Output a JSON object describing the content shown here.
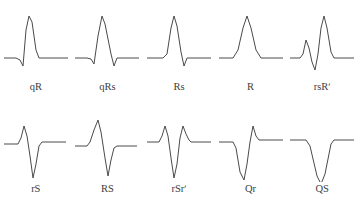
{
  "figure": {
    "title_visible_fragment": "",
    "background_color": "#ffffff",
    "stroke_color": "#4a4a4a",
    "label_color": "#3d3d3d",
    "rows": 2,
    "columns": 5
  },
  "patterns": [
    {
      "id": "qR",
      "label": "qR",
      "row": 0,
      "col": 0,
      "description": "small initial negative q deflection followed by tall positive R wave",
      "points": "2,48 14,48 18,50 21,56 24,20 27,6 30,12 34,40 37,48 50,48 66,48"
    },
    {
      "id": "qRs",
      "label": "qRs",
      "row": 0,
      "col": 1,
      "description": "small q, tall R, small terminal s",
      "points": "2,48 14,48 18,49 21,54 25,26 29,6 32,14 38,44 41,56 44,48 54,48 66,48"
    },
    {
      "id": "Rs",
      "label": "Rs",
      "row": 0,
      "col": 2,
      "description": "tall R wave followed by small s deflection",
      "points": "2,48 18,48 22,44 26,18 29,6 32,16 36,42 39,56 42,48 54,48 66,48"
    },
    {
      "id": "R",
      "label": "R",
      "row": 0,
      "col": 3,
      "description": "single monophasic positive R wave, no negative deflection",
      "points": "2,48 16,48 21,40 26,18 30,6 34,18 39,40 44,48 56,48 66,48"
    },
    {
      "id": "rsR'",
      "label": "rsRʹ",
      "row": 0,
      "col": 4,
      "description": "small r, s deflection, then tall second R prime wave",
      "points": "2,48 12,48 15,44 18,30 21,38 24,52 27,60 30,44 33,18 36,6 39,18 43,42 46,48 56,48 66,48"
    },
    {
      "id": "rS",
      "label": "rS",
      "row": 1,
      "col": 0,
      "description": "small initial r wave then deep S wave",
      "points": "2,32 16,32 19,26 22,14 25,24 28,44 31,66 34,52 37,34 40,30 50,30 64,30"
    },
    {
      "id": "RS",
      "label": "RS",
      "row": 1,
      "col": 1,
      "description": "tall R wave and deep S wave of comparable size",
      "points": "2,34 14,34 17,30 21,18 25,8 28,20 32,46 35,64 38,48 41,36 44,34 54,34 64,34"
    },
    {
      "id": "rSr'",
      "label": "rSrʹ",
      "row": 1,
      "col": 2,
      "description": "small r, deep S, then small terminal r prime",
      "points": "2,30 14,30 17,24 20,14 23,24 26,46 29,66 32,52 35,26 38,14 41,22 44,28 46,30 56,30 66,30"
    },
    {
      "id": "Qr",
      "label": "Qr",
      "row": 1,
      "col": 3,
      "description": "deep initial Q wave followed by small r wave",
      "points": "2,30 16,30 19,36 23,60 27,68 30,52 33,30 36,14 39,24 42,28 46,28 56,28 66,28"
    },
    {
      "id": "QS",
      "label": "QS",
      "row": 1,
      "col": 4,
      "description": "single entirely negative QS deflection",
      "points": "2,28 18,28 22,34 29,64 33,72 37,62 43,32 46,28 58,28 66,28"
    }
  ]
}
